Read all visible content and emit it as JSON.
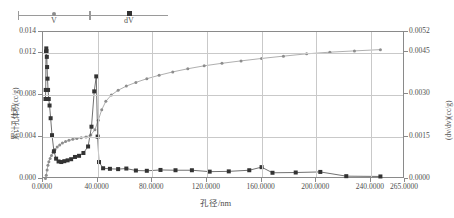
{
  "legend": {
    "entries": [
      {
        "label": "V",
        "marker": "circle-marker",
        "color": "#8d8d8d"
      },
      {
        "label": "dV",
        "marker": "square-marker",
        "color": "#333333"
      }
    ]
  },
  "axes": {
    "x": {
      "title": "孔径/nm",
      "ticks": [
        "0.0000",
        "40.0000",
        "80.0000",
        "120.0000",
        "160.0000",
        "200.0000",
        "240.0000",
        "265.0000"
      ],
      "tick_values": [
        0,
        40,
        80,
        120,
        160,
        200,
        240,
        265
      ],
      "min": 0,
      "max": 265
    },
    "y_left": {
      "title": "累计孔体积(cc/g)",
      "ticks": [
        "0.000",
        "0.004",
        "0.008",
        "0.012",
        "0.014"
      ],
      "tick_values": [
        0,
        0.004,
        0.008,
        0.012,
        0.014
      ],
      "min": 0,
      "max": 0.014
    },
    "y_right": {
      "title": "(dv/dv)(cc/g)",
      "ticks": [
        "0.0000",
        "0.0015",
        "0.0030",
        "0.0045",
        "0.0052"
      ],
      "tick_values": [
        0,
        0.0015,
        0.003,
        0.0045,
        0.0052
      ],
      "min": 0,
      "max": 0.0052
    }
  },
  "chart_data": {
    "type": "line",
    "title": "",
    "xlabel": "孔径/nm",
    "ylabel": "累计孔体积(cc/g)",
    "y2label": "(dv/dv)(cc/g)",
    "xlim": [
      0,
      265
    ],
    "ylim": [
      0,
      0.014
    ],
    "y2lim": [
      0,
      0.0052
    ],
    "grid": true,
    "legend_position": "top-left",
    "series": [
      {
        "name": "V",
        "axis": "left",
        "marker": "circle",
        "color": "#8d8d8d",
        "points": [
          [
            1.8,
            5e-05
          ],
          [
            2.4,
            0.00035
          ],
          [
            3.0,
            0.00085
          ],
          [
            3.6,
            0.0013
          ],
          [
            4.3,
            0.00165
          ],
          [
            5.2,
            0.00195
          ],
          [
            6.2,
            0.00225
          ],
          [
            7.4,
            0.00255
          ],
          [
            8.8,
            0.00282
          ],
          [
            10.4,
            0.00305
          ],
          [
            12.2,
            0.00325
          ],
          [
            14.2,
            0.00342
          ],
          [
            16.5,
            0.00356
          ],
          [
            19.0,
            0.00368
          ],
          [
            21.8,
            0.00378
          ],
          [
            24.8,
            0.00386
          ],
          [
            28.0,
            0.00394
          ],
          [
            31.5,
            0.00401
          ],
          [
            35.0,
            0.0042
          ],
          [
            38.0,
            0.0047
          ],
          [
            40.5,
            0.0056
          ],
          [
            43.0,
            0.0066
          ],
          [
            46.0,
            0.0074
          ],
          [
            50.0,
            0.008
          ],
          [
            55.0,
            0.00845
          ],
          [
            61.0,
            0.00885
          ],
          [
            68.0,
            0.0092
          ],
          [
            76.0,
            0.00955
          ],
          [
            85.0,
            0.00988
          ],
          [
            95.0,
            0.0102
          ],
          [
            106.0,
            0.0105
          ],
          [
            118.0,
            0.01078
          ],
          [
            131.0,
            0.01102
          ],
          [
            145.0,
            0.01125
          ],
          [
            160.0,
            0.01148
          ],
          [
            176.0,
            0.0117
          ],
          [
            193.0,
            0.01192
          ],
          [
            210.0,
            0.01208
          ],
          [
            228.0,
            0.0122
          ],
          [
            247.0,
            0.01232
          ]
        ]
      },
      {
        "name": "dV",
        "axis": "right",
        "marker": "square",
        "color": "#333333",
        "points": [
          [
            1.8,
            0.00283
          ],
          [
            2.0,
            0.00315
          ],
          [
            2.2,
            0.0045
          ],
          [
            2.4,
            0.00462
          ],
          [
            2.6,
            0.00452
          ],
          [
            2.8,
            0.00432
          ],
          [
            3.0,
            0.00396
          ],
          [
            3.3,
            0.00355
          ],
          [
            3.7,
            0.00315
          ],
          [
            4.2,
            0.00283
          ],
          [
            4.8,
            0.0026
          ],
          [
            5.6,
            0.00215
          ],
          [
            6.6,
            0.00155
          ],
          [
            8.0,
            0.00098
          ],
          [
            9.6,
            0.00072
          ],
          [
            11.4,
            0.00062
          ],
          [
            13.4,
            0.0006
          ],
          [
            15.6,
            0.00063
          ],
          [
            18.0,
            0.00066
          ],
          [
            20.6,
            0.0007
          ],
          [
            23.4,
            0.00078
          ],
          [
            26.4,
            0.00082
          ],
          [
            29.6,
            0.00092
          ],
          [
            33.0,
            0.00115
          ],
          [
            35.5,
            0.00185
          ],
          [
            37.5,
            0.0031
          ],
          [
            39.0,
            0.00363
          ],
          [
            40.0,
            0.0015
          ],
          [
            41.0,
            0.0006
          ],
          [
            44.0,
            0.00038
          ],
          [
            49.0,
            0.00036
          ],
          [
            55.0,
            0.00035
          ],
          [
            61.0,
            0.00037
          ],
          [
            68.0,
            0.0003
          ],
          [
            76.0,
            0.00029
          ],
          [
            86.0,
            0.00032
          ],
          [
            97.0,
            0.00031
          ],
          [
            109.0,
            0.00031
          ],
          [
            122.0,
            0.00026
          ],
          [
            136.0,
            0.00027
          ],
          [
            151.0,
            0.00031
          ],
          [
            160.0,
            0.00042
          ],
          [
            168.0,
            0.00022
          ],
          [
            185.0,
            0.00023
          ],
          [
            203.0,
            0.00025
          ],
          [
            222.0,
            0.0001
          ],
          [
            247.0,
            9e-05
          ]
        ]
      }
    ]
  }
}
